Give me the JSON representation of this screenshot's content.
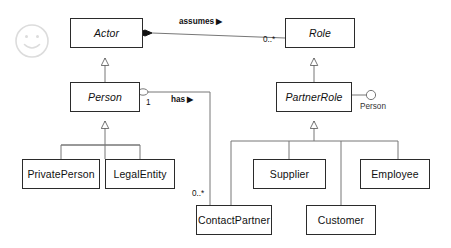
{
  "diagram": {
    "type": "uml-class-diagram",
    "background_color": "#ffffff",
    "line_color": "#4a4a4a",
    "box_border_color": "#2b2b2b",
    "text_color": "#111111",
    "watermark": {
      "name": "smiley-face-watermark",
      "color": "#dcdcdc"
    },
    "classes": [
      {
        "id": "actor",
        "label": "Actor",
        "abstract": true,
        "x": 70,
        "y": 18,
        "w": 73,
        "h": 30
      },
      {
        "id": "role",
        "label": "Role",
        "abstract": true,
        "x": 285,
        "y": 18,
        "w": 70,
        "h": 30
      },
      {
        "id": "person",
        "label": "Person",
        "abstract": true,
        "x": 70,
        "y": 82,
        "w": 70,
        "h": 30
      },
      {
        "id": "partnerrole",
        "label": "PartnerRole",
        "abstract": true,
        "x": 276,
        "y": 82,
        "w": 76,
        "h": 30
      },
      {
        "id": "privateperson",
        "label": "PrivatePerson",
        "abstract": false,
        "x": 22,
        "y": 159,
        "w": 78,
        "h": 30
      },
      {
        "id": "legalentity",
        "label": "LegalEntity",
        "abstract": false,
        "x": 105,
        "y": 159,
        "w": 70,
        "h": 30
      },
      {
        "id": "supplier",
        "label": "Supplier",
        "abstract": false,
        "x": 253,
        "y": 159,
        "w": 73,
        "h": 30
      },
      {
        "id": "employee",
        "label": "Employee",
        "abstract": false,
        "x": 360,
        "y": 159,
        "w": 70,
        "h": 30
      },
      {
        "id": "contactpartner",
        "label": "ContactPartner",
        "abstract": false,
        "x": 196,
        "y": 205,
        "w": 76,
        "h": 30
      },
      {
        "id": "customer",
        "label": "Customer",
        "abstract": false,
        "x": 306,
        "y": 205,
        "w": 70,
        "h": 30
      }
    ],
    "associations": [
      {
        "id": "assumes",
        "label": "assumes",
        "direction_marker": "▶",
        "from": "role",
        "to": "actor",
        "end_decoration_at_to": "filled-diamond",
        "multiplicity_at_from": "0..*"
      },
      {
        "id": "has",
        "label": "has",
        "direction_marker": "▶",
        "from": "person",
        "to": "contactpartner",
        "end_decoration_at_from": "open-diamond",
        "multiplicity_at_from": "1",
        "multiplicity_at_to": "0..*"
      }
    ],
    "generalizations": [
      {
        "id": "person-to-actor",
        "child": "person",
        "parent": "actor"
      },
      {
        "id": "privateperson-to-person",
        "child": "privateperson",
        "parent": "person"
      },
      {
        "id": "legalentity-to-person",
        "child": "legalentity",
        "parent": "person"
      },
      {
        "id": "partnerrole-to-role",
        "child": "partnerrole",
        "parent": "role"
      },
      {
        "id": "contactpartner-to-partnerrole",
        "child": "contactpartner",
        "parent": "partnerrole"
      },
      {
        "id": "supplier-to-partnerrole",
        "child": "supplier",
        "parent": "partnerrole"
      },
      {
        "id": "customer-to-partnerrole",
        "child": "customer",
        "parent": "partnerrole"
      },
      {
        "id": "employee-to-partnerrole",
        "child": "employee",
        "parent": "partnerrole"
      }
    ],
    "interfaces": [
      {
        "id": "person-required-interface",
        "label": "Person",
        "owner": "partnerrole",
        "notation": "lollipop-socket"
      }
    ],
    "labels": {
      "assumes": "assumes",
      "assumes_arrow": "▶",
      "has": "has",
      "has_arrow": "▶",
      "mult_role_end": "0..*",
      "mult_person_end": "1",
      "mult_contactpartner_end": "0..*",
      "iface_person": "Person"
    }
  }
}
